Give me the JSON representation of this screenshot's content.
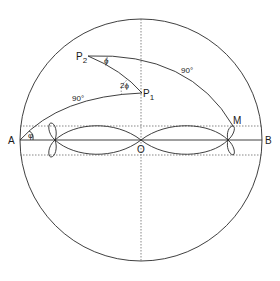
{
  "diagram": {
    "title": "",
    "points": {
      "A": {
        "label": "A",
        "x": 20,
        "y": 140
      },
      "B": {
        "label": "B",
        "x": 262,
        "y": 140
      },
      "O": {
        "label": "O",
        "x": 141,
        "y": 140
      },
      "P1": {
        "label": "P",
        "sub": "1",
        "x": 142,
        "y": 93
      },
      "P2": {
        "label": "P",
        "sub": "2",
        "x": 88,
        "y": 56
      },
      "M": {
        "label": "M",
        "x": 233,
        "y": 126
      }
    },
    "angle_labels": {
      "phi_at_A": "φ",
      "phi_at_P2": "ϕ",
      "two_phi_at_P1": "2ϕ"
    },
    "arc_labels": {
      "arc_A_P1": "90°",
      "arc_P2_M": "90°"
    },
    "colors": {
      "stroke": "#2a2a2a",
      "background": "#ffffff"
    }
  }
}
